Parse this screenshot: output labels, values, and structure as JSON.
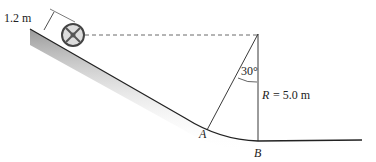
{
  "diagram": {
    "wheel_height_label": "1.2 m",
    "angle_label": "30°",
    "radius_label_var": "R",
    "radius_label_value": " = 5.0 m",
    "point_a": "A",
    "point_b": "B",
    "colors": {
      "line": "#222222",
      "shade": "#b0b0b0"
    }
  }
}
